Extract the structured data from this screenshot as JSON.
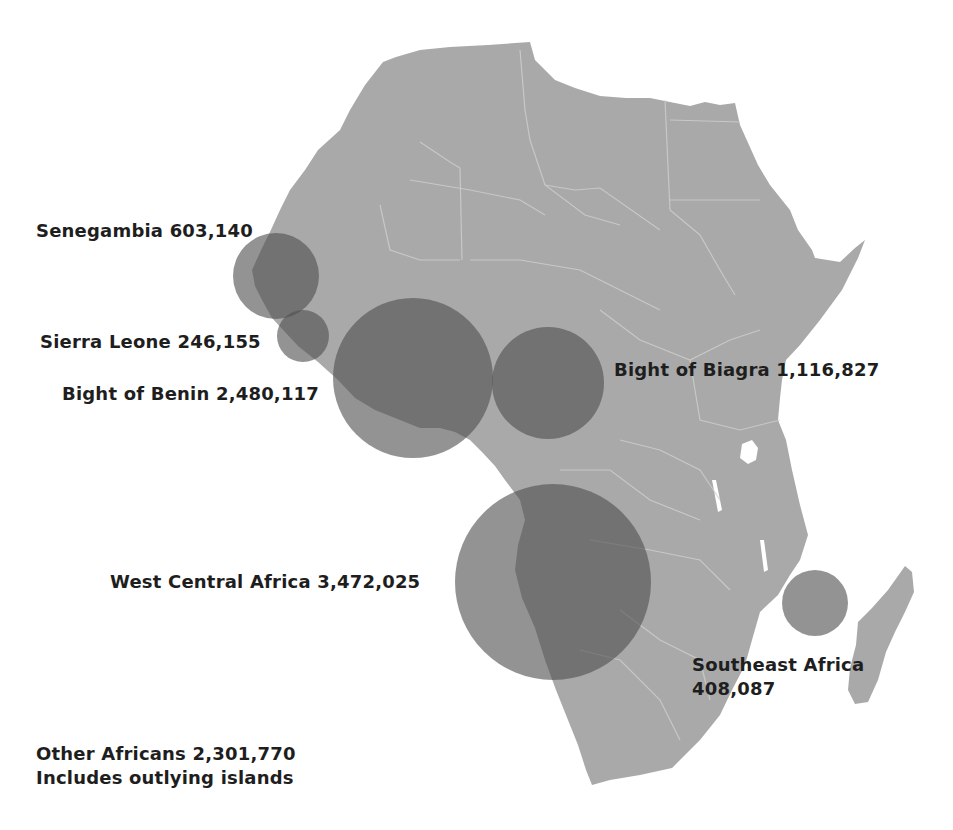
{
  "map": {
    "title": "",
    "land_color": "#a9a9a9",
    "border_color": "#d4d4d4",
    "circle_color": "#555555",
    "circle_opacity": 0.6
  },
  "regions": [
    {
      "name": "Senegambia",
      "value": "603,140",
      "label": "Senegambia 603,140",
      "cx": 276,
      "cy": 276,
      "r": 43
    },
    {
      "name": "Sierra Leone",
      "value": "246,155",
      "label": "Sierra Leone 246,155",
      "cx": 303,
      "cy": 336,
      "r": 26
    },
    {
      "name": "Bight of Benin",
      "value": "2,480,117",
      "label": "Bight of Benin 2,480,117",
      "cx": 413,
      "cy": 378,
      "r": 80
    },
    {
      "name": "Bight of Biagra",
      "value": "1,116,827",
      "label": "Bight of Biagra 1,116,827",
      "cx": 548,
      "cy": 383,
      "r": 56
    },
    {
      "name": "West Central Africa",
      "value": "3,472,025",
      "label": "West Central Africa 3,472,025",
      "cx": 553,
      "cy": 582,
      "r": 98
    },
    {
      "name": "Southeast Africa",
      "value": "408,087",
      "label_line1": "Southeast Africa",
      "label_line2": "408,087",
      "cx": 815,
      "cy": 603,
      "r": 33
    },
    {
      "name": "Other Africans",
      "value": "2,301,770",
      "label_line1": "Other Africans 2,301,770",
      "label_line2": "Includes outlying islands"
    }
  ]
}
